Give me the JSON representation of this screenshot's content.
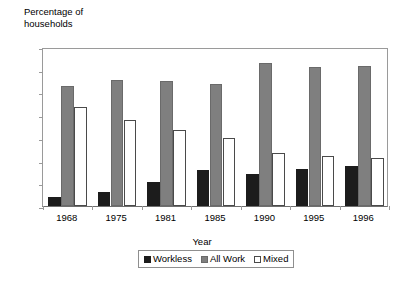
{
  "chart_data": {
    "type": "bar",
    "title": "",
    "xlabel": "Year",
    "ylabel": "Percentage of\nhouseholds",
    "categories": [
      "1968",
      "1975",
      "1981",
      "1985",
      "1990",
      "1995",
      "1996"
    ],
    "series": [
      {
        "name": "Workless",
        "color": "#1c1c1c",
        "values": [
          4,
          6,
          10.5,
          16,
          14,
          16.5,
          17.5
        ]
      },
      {
        "name": "All Work",
        "color": "#7f7f7f",
        "values": [
          53,
          55.5,
          55,
          53.5,
          63,
          61,
          61.5
        ]
      },
      {
        "name": "Mixed",
        "color": "#ffffff",
        "values": [
          43.5,
          38,
          33.5,
          30,
          23.5,
          22,
          21
        ]
      }
    ],
    "ylim": [
      0,
      70
    ],
    "ytick_values": [
      0,
      10,
      20,
      30,
      40,
      50,
      60,
      70
    ],
    "ytick_labels": [
      "0",
      "10",
      "20",
      "30",
      "40",
      "50",
      "60",
      "70"
    ],
    "grid": false,
    "legend_position": "bottom"
  },
  "legend": {
    "entries": [
      {
        "label": "Workless"
      },
      {
        "label": "All Work"
      },
      {
        "label": "Mixed"
      }
    ]
  }
}
